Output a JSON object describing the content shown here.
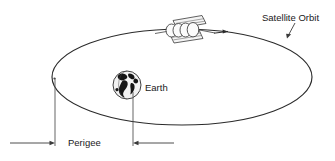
{
  "canvas": {
    "width": 335,
    "height": 161,
    "background": "#ffffff",
    "line_color": "#2b2b2b"
  },
  "labels": {
    "satellite_orbit": "Satellite Orbit",
    "earth": "Earth",
    "perigee": "Perigee"
  },
  "diagram": {
    "title_implicit": "Satellite Orbit around Earth showing Perigee",
    "orbit": {
      "shape": "ellipse",
      "center_x": 182,
      "center_y": 77,
      "radius_x": 130,
      "radius_y": 48,
      "direction_marker": "arrow",
      "direction": "clockwise-right"
    },
    "earth": {
      "center_x": 127,
      "center_y": 85,
      "radius": 14
    },
    "satellite": {
      "center_x": 186,
      "center_y": 30,
      "body_segments": 4,
      "panels": 2
    },
    "perigee_dimension": {
      "left_extension_x": 55,
      "right_extension_x": 133,
      "baseline_y": 143
    }
  }
}
